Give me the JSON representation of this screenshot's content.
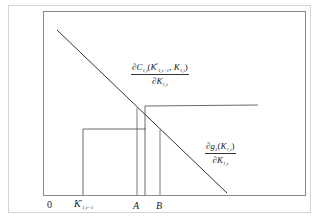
{
  "diagram": {
    "origin_label": "0",
    "axis_labels": {
      "k_prev": {
        "base": "K",
        "sup": "*",
        "sub": "1,t−1"
      },
      "a": "A",
      "b": "B"
    },
    "curves": {
      "marginal_cost": {
        "numerator_prefix": "∂C",
        "numerator_sub": "1,t",
        "numerator_args_open": "(",
        "arg1_base": "K",
        "arg1_sup": "*",
        "arg1_sub": "1,t−1",
        "arg_sep": ", ",
        "arg2_base": "K",
        "arg2_sub": "1,t",
        "numerator_args_close": ")",
        "denominator_prefix": "∂K",
        "denominator_sub": "1,t"
      },
      "marginal_benefit": {
        "numerator_prefix": "∂g",
        "numerator_sub": "1",
        "numerator_args_open": "(",
        "arg_base": "K",
        "arg_sub": "1,t",
        "numerator_args_close": ")",
        "denominator_prefix": "∂K",
        "denominator_sub": "1,t"
      }
    },
    "colors": {
      "lines": "#333333",
      "inner_frame": "#8a8a8a",
      "outer_frame": "#d4d4d4"
    }
  }
}
